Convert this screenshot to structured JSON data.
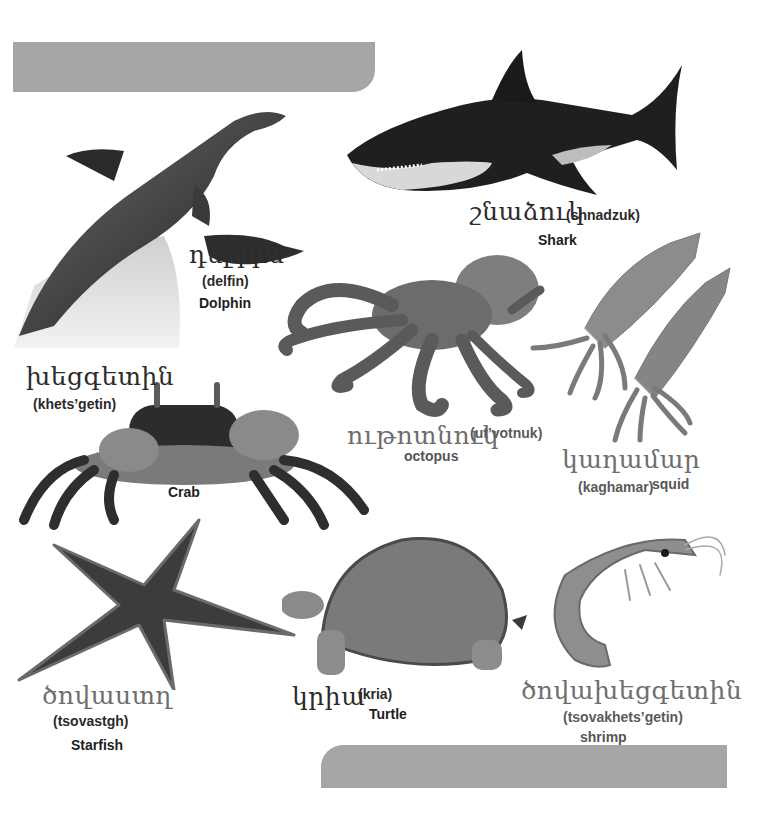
{
  "page": {
    "background": "#ffffff",
    "banner_color": "#a6a6a6"
  },
  "animals": {
    "dolphin": {
      "armenian": "դելֆին",
      "transliteration": "(delfin)",
      "english": "Dolphin"
    },
    "shark": {
      "armenian": "շնաձուկ",
      "transliteration": "(shnadzuk)",
      "english": "Shark"
    },
    "crab": {
      "armenian": "խեցգետին",
      "transliteration": "(khets’getin)",
      "english": "Crab"
    },
    "octopus": {
      "armenian": "ութոտնուկ",
      "transliteration": "(ut’votnuk)",
      "english": "octopus"
    },
    "squid": {
      "armenian": "կաղամար",
      "transliteration": "(kaghamar)",
      "english": "squid"
    },
    "starfish": {
      "armenian": "ծովաստղ",
      "transliteration": "(tsovastgh)",
      "english": "Starfish"
    },
    "turtle": {
      "armenian": "կրիա",
      "transliteration": "(kria)",
      "english": "Turtle"
    },
    "shrimp": {
      "armenian": "ծովախեցգետին",
      "transliteration": "(tsovakhets’getin)",
      "english": "shrimp"
    }
  }
}
